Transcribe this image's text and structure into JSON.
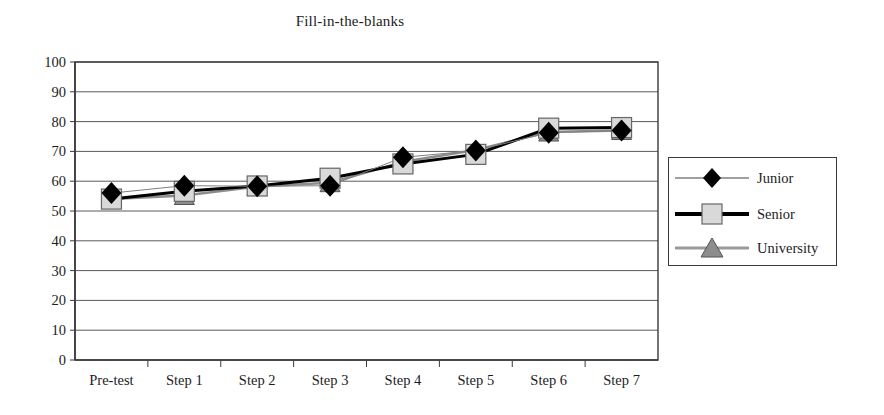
{
  "chart_data": {
    "type": "line",
    "title": "Fill-in-the-blanks",
    "xlabel": "",
    "ylabel": "",
    "ylim": [
      0,
      100
    ],
    "ytick_step": 10,
    "yticks": [
      "100",
      "90",
      "80",
      "70",
      "60",
      "50",
      "40",
      "30",
      "20",
      "10",
      "0"
    ],
    "grid": "horizontal",
    "legend_position": "right-outside",
    "categories": [
      "Pre-test",
      "Step 1",
      "Step 2",
      "Step 3",
      "Step 4",
      "Step 5",
      "Step 6",
      "Step 7"
    ],
    "series": [
      {
        "name": "Junior",
        "marker": "diamond",
        "marker_color": "#000000",
        "line_color": "#808080",
        "line_width": 1,
        "values": [
          56,
          58.5,
          58.3,
          58.5,
          68,
          70.3,
          76.3,
          77
        ]
      },
      {
        "name": "Senior",
        "marker": "square",
        "marker_color": "#d9d9d9",
        "line_color": "#000000",
        "line_width": 3,
        "values": [
          54,
          56.6,
          58.4,
          61,
          65.8,
          69,
          77.8,
          78
        ]
      },
      {
        "name": "University",
        "marker": "triangle",
        "marker_color": "#8c8c8c",
        "line_color": "#8c8c8c",
        "line_width": 2.5,
        "values": [
          54,
          55.2,
          58.2,
          59.5,
          66.5,
          70.5,
          76.5,
          77
        ]
      }
    ]
  },
  "legend": {
    "items": [
      {
        "label": "Junior"
      },
      {
        "label": "Senior"
      },
      {
        "label": "University"
      }
    ]
  },
  "colors": {
    "axis": "#3a3a3a",
    "grid": "#5a5a5a",
    "junior_marker": "#000000",
    "senior_marker": "#d9d9d9",
    "university_marker": "#8c8c8c",
    "text": "#1c1c1c"
  }
}
